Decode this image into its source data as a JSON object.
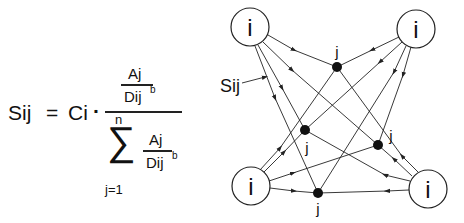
{
  "formula": {
    "lhs": "Sij",
    "equals": "=",
    "coefficient": "Ci",
    "dot": "·",
    "numerator": {
      "top": "Aj",
      "bottom": "Dij",
      "exponent": "b"
    },
    "denominator": {
      "sum_symbol": "∑",
      "upper_limit": "n",
      "lower_limit": "j=1",
      "top": "Aj",
      "bottom": "Dij",
      "exponent": "b"
    }
  },
  "diagram": {
    "origin_label": "i",
    "destination_label": "j",
    "flow_label": "Sij",
    "colors": {
      "stroke": "#222222",
      "node_fill": "#111111",
      "background": "#ffffff"
    }
  }
}
